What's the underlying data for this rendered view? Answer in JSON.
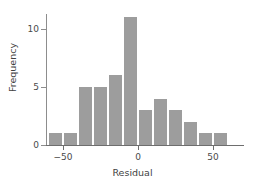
{
  "chart_data": {
    "type": "bar",
    "title": "",
    "subtitle": "",
    "xlabel": "Residual",
    "ylabel": "Frequency",
    "grid": false,
    "legend": null,
    "legend_position": "none",
    "bin_width": 10,
    "bin_edges": [
      -60,
      -50,
      -40,
      -30,
      -20,
      -10,
      0,
      10,
      20,
      30,
      40,
      50,
      60
    ],
    "categories": [
      "-60 to -50",
      "-50 to -40",
      "-40 to -30",
      "-30 to -20",
      "-20 to -10",
      "-10 to 0",
      "0 to 10",
      "10 to 20",
      "20 to 30",
      "30 to 40",
      "40 to 50",
      "50 to 60"
    ],
    "bin_centers": [
      -55,
      -45,
      -35,
      -25,
      -15,
      -5,
      5,
      15,
      25,
      35,
      45,
      55
    ],
    "values": [
      1,
      1,
      5,
      5,
      6,
      11,
      3,
      4,
      3,
      2,
      1,
      1
    ],
    "xlim": [
      -65,
      67
    ],
    "ylim": [
      0,
      11.6
    ],
    "xticks": [
      -50,
      0,
      50
    ],
    "xtick_labels": [
      "−50",
      "0",
      "50"
    ],
    "yticks": [
      0,
      5,
      10
    ],
    "ytick_labels": [
      "0",
      "5",
      "10"
    ],
    "bar_color": "#9d9d9d",
    "bar_edge_color": "#ffffff",
    "axis_color": "#6e6e6e",
    "text_color": "#4a4a4a",
    "background": "#ffffff"
  }
}
